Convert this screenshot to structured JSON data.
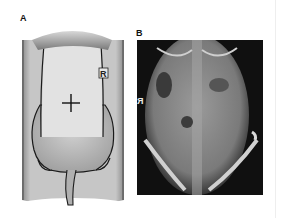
{
  "figure": {
    "panels": [
      {
        "label": "A",
        "description": "Schematic of rat in prone position on platform with marked field",
        "marker_center": "+",
        "side_marker": "R"
      },
      {
        "label": "B",
        "description": "Radiograph (X-ray) of rat abdomen and pelvis, ventrodorsal view",
        "side_marker": "R"
      }
    ]
  },
  "colors": {
    "background": "#ffffff",
    "platform": "#c8c8c8",
    "field": "#e2e2e2",
    "outline": "#1a1a1a",
    "xray_bg": "#101010"
  }
}
